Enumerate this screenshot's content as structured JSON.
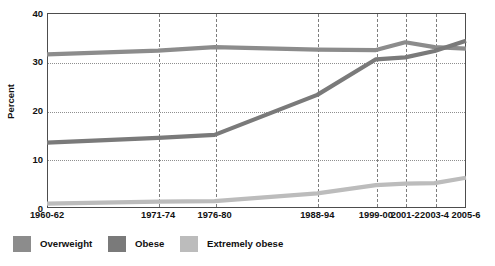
{
  "chart_data": {
    "type": "line",
    "title": "",
    "xlabel": "",
    "ylabel": "Percent",
    "ylim": [
      0,
      40
    ],
    "yticks": [
      0,
      10,
      20,
      30,
      40
    ],
    "grid": "dotted-horizontal-and-dashed-vertical",
    "legend_position": "below-plot-left",
    "categories": [
      "1960-62",
      "1971-74",
      "1976-80",
      "1988-94",
      "1999-00",
      "2001-2",
      "2003-4",
      "2005-6"
    ],
    "category_x_fraction": [
      0.0,
      0.265,
      0.4,
      0.645,
      0.785,
      0.855,
      0.925,
      1.0
    ],
    "series": [
      {
        "name": "Overweight",
        "color": "#8c8c8c",
        "values": [
          31.5,
          32.3,
          33.0,
          32.5,
          32.4,
          34.0,
          33.0,
          32.7
        ]
      },
      {
        "name": "Obese",
        "color": "#7a7a7a",
        "values": [
          13.4,
          14.4,
          15.0,
          23.2,
          30.5,
          30.9,
          32.2,
          34.3
        ]
      },
      {
        "name": "Extremely obese",
        "color": "#bcbcbc",
        "values": [
          0.9,
          1.3,
          1.4,
          3.0,
          4.7,
          5.0,
          5.1,
          6.2
        ]
      }
    ]
  },
  "axis": {
    "y_title": "Percent",
    "y_tick_labels": [
      "40",
      "30",
      "20",
      "10",
      "0"
    ]
  },
  "legend": {
    "items": [
      {
        "label": "Overweight",
        "color": "#8c8c8c"
      },
      {
        "label": "Obese",
        "color": "#7a7a7a"
      },
      {
        "label": "Extremely obese",
        "color": "#bcbcbc"
      }
    ]
  },
  "colors": {
    "axis": "#4d4d4d",
    "gridline": "#8f8f8f",
    "vgridline": "#7d7d7d",
    "text": "#111111",
    "background": "#ffffff"
  }
}
